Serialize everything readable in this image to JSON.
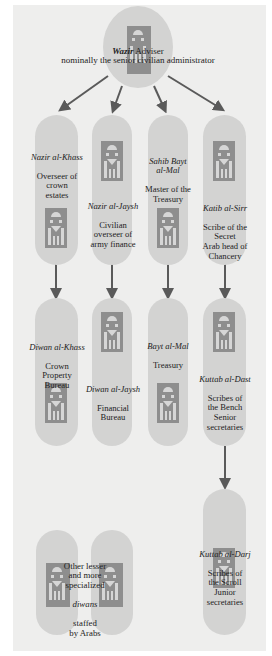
{
  "root": {
    "title_italic": "Wazir",
    "title": "Adviser",
    "description": "nominally the senior civilian administrator"
  },
  "level1": [
    {
      "title": "Nazir al-Khass",
      "description": "Overseer of\ncrown\nestates"
    },
    {
      "title": "Nazir al-Jaysh",
      "description": "Civilian\noverseer of\narmy finance"
    },
    {
      "title": "Sahib Bayt\nal-Mal",
      "description": "Master of the\nTreasury"
    },
    {
      "title": "Katib al-Sirr",
      "description": "Scribe of the\nSecret\nArab head of\nChancery"
    }
  ],
  "level2": [
    {
      "title": "Diwan al-Khass",
      "description": "Crown\nProperty\nBureau"
    },
    {
      "title": "Diwan al-Jaysh",
      "description": "Financial\nBureau"
    },
    {
      "title": "Bayt al-Mal",
      "description": "Treasury"
    },
    {
      "title": "Kuttab al-Dast",
      "description": "Scribes of\nthe Bench\nSenior\nsecretaries"
    }
  ],
  "level3": {
    "title": "Kuttab al-Darj",
    "description": "Scribes of\nthe Scroll\nJunior\nsecretaries"
  },
  "other": {
    "line1": "Other lesser\nand more\nspecialized",
    "italic": "diwans",
    "line2": "staffed\nby Arabs"
  },
  "colors": {
    "background": "#eeeeed",
    "node": "#d3d3d2",
    "figure": "#8e8e8e",
    "arrow": "#5a5a5a"
  }
}
